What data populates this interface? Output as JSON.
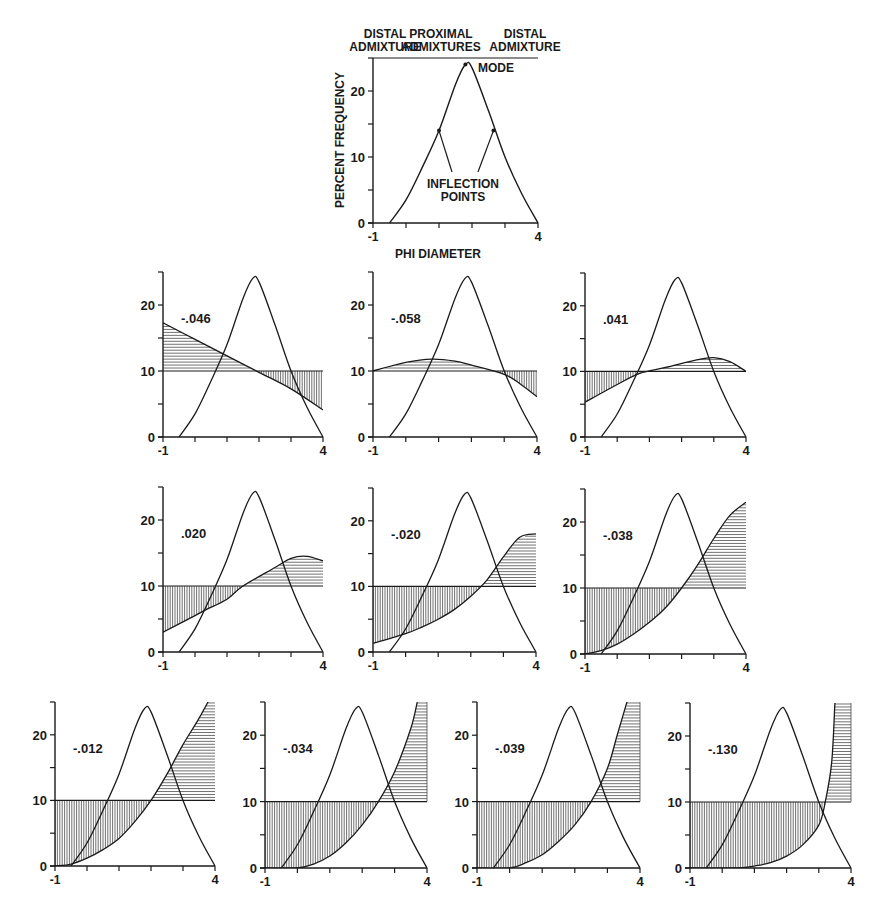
{
  "chart_data": [
    {
      "id": "reference",
      "type": "line",
      "title": "",
      "xlabel": "PHI DIAMETER",
      "ylabel": "PERCENT FREQUENCY",
      "xlim": [
        -1,
        4
      ],
      "ylim": [
        0,
        25
      ],
      "x_tick_labels": [
        "-1",
        "4"
      ],
      "y_tick_labels": [
        "0",
        "10",
        "20"
      ],
      "grid": false,
      "annotations": {
        "top_labels": [
          {
            "line1": "DISTAL",
            "line2": "ADMIXTURE"
          },
          {
            "line1": "PROXIMAL",
            "line2": "ADMIXTURES"
          },
          {
            "line1": "DISTAL",
            "line2": "ADMIXTURE"
          }
        ],
        "mode_label": "MODE",
        "inflection_label_line1": "INFLECTION",
        "inflection_label_line2": "POINTS"
      },
      "series": [
        {
          "name": "grain-size distribution",
          "x": [
            -0.5,
            0,
            0.5,
            1,
            1.5,
            1.8,
            2,
            2.5,
            3,
            3.5,
            4
          ],
          "y": [
            0,
            3.5,
            8.5,
            14,
            21,
            24,
            23.5,
            17,
            10,
            4.5,
            0
          ]
        }
      ],
      "mode": {
        "x": 1.8,
        "y": 24
      },
      "inflection_points": [
        {
          "x": 1.0,
          "y": 14
        },
        {
          "x": 2.65,
          "y": 14
        }
      ]
    },
    {
      "id": "p1",
      "type": "area",
      "label": "-.046",
      "xlim": [
        -1,
        4
      ],
      "ylim": [
        0,
        25
      ],
      "x_tick_labels": [
        "-1",
        "4"
      ],
      "y_tick_labels": [
        "0",
        "10",
        "20"
      ],
      "baseline": 10,
      "series": [
        {
          "name": "distribution",
          "x": [
            -0.5,
            0,
            0.5,
            1,
            1.5,
            1.8,
            2,
            2.5,
            3,
            3.5,
            4
          ],
          "y": [
            0,
            3.5,
            8.5,
            14,
            21,
            24,
            23.5,
            17,
            10,
            4.5,
            0
          ]
        },
        {
          "name": "weighting function",
          "x": [
            -1,
            0,
            1,
            2,
            3,
            4
          ],
          "y": [
            17.3,
            14.8,
            12.3,
            9.8,
            7.3,
            4.1
          ]
        }
      ]
    },
    {
      "id": "p2",
      "type": "area",
      "label": "-.058",
      "xlim": [
        -1,
        4
      ],
      "ylim": [
        0,
        25
      ],
      "x_tick_labels": [
        "-1",
        "4"
      ],
      "y_tick_labels": [
        "0",
        "10",
        "20"
      ],
      "baseline": 10,
      "series": [
        {
          "name": "distribution",
          "x": [
            -0.5,
            0,
            0.5,
            1,
            1.5,
            1.8,
            2,
            2.5,
            3,
            3.5,
            4
          ],
          "y": [
            0,
            3.5,
            8.5,
            14,
            21,
            24,
            23.5,
            17,
            10,
            4.5,
            0
          ]
        },
        {
          "name": "weighting function",
          "x": [
            -1,
            0,
            0.8,
            1.5,
            2,
            3,
            3.5,
            4
          ],
          "y": [
            10,
            11.3,
            11.8,
            11.5,
            10.9,
            9.5,
            8,
            6.1
          ]
        }
      ]
    },
    {
      "id": "p3",
      "type": "area",
      "label": ".041",
      "xlim": [
        -1,
        4
      ],
      "ylim": [
        0,
        25
      ],
      "x_tick_labels": [
        "-1",
        "4"
      ],
      "y_tick_labels": [
        "0",
        "10",
        "20"
      ],
      "baseline": 10,
      "series": [
        {
          "name": "distribution",
          "x": [
            -0.5,
            0,
            0.5,
            1,
            1.5,
            1.8,
            2,
            2.5,
            3,
            3.5,
            4
          ],
          "y": [
            0,
            3.5,
            8.5,
            14,
            21,
            24,
            23.5,
            17,
            10,
            4.5,
            0
          ]
        },
        {
          "name": "weighting function",
          "x": [
            -1,
            0,
            0.7,
            1.5,
            2.5,
            3,
            3.5,
            4
          ],
          "y": [
            5.3,
            8,
            9.7,
            10.6,
            11.8,
            12.1,
            11.5,
            10
          ]
        }
      ]
    },
    {
      "id": "p4",
      "type": "area",
      "label": ".020",
      "xlim": [
        -1,
        4
      ],
      "ylim": [
        0,
        25
      ],
      "x_tick_labels": [
        "-1",
        "4"
      ],
      "y_tick_labels": [
        "0",
        "10",
        "20"
      ],
      "baseline": 10,
      "series": [
        {
          "name": "distribution",
          "x": [
            -0.5,
            0,
            0.5,
            1,
            1.5,
            1.8,
            2,
            2.5,
            3,
            3.5,
            4
          ],
          "y": [
            0,
            3.5,
            8.5,
            14,
            21,
            24,
            23.5,
            17,
            10,
            4.5,
            0
          ]
        },
        {
          "name": "weighting function",
          "x": [
            -1,
            0,
            0.3,
            1,
            1.5,
            2.5,
            3,
            3.5,
            4
          ],
          "y": [
            3,
            5.5,
            6.3,
            8,
            10,
            12.8,
            14.2,
            14.5,
            13.8
          ]
        }
      ]
    },
    {
      "id": "p5",
      "type": "area",
      "label": "-.020",
      "xlim": [
        -1,
        4
      ],
      "ylim": [
        0,
        25
      ],
      "x_tick_labels": [
        "-1",
        "4"
      ],
      "y_tick_labels": [
        "0",
        "10",
        "20"
      ],
      "baseline": 10,
      "series": [
        {
          "name": "distribution",
          "x": [
            -0.5,
            0,
            0.5,
            1,
            1.5,
            1.8,
            2,
            2.5,
            3,
            3.5,
            4
          ],
          "y": [
            0,
            3.5,
            8.5,
            14,
            21,
            24,
            23.5,
            17,
            10,
            4.5,
            0
          ]
        },
        {
          "name": "weighting function",
          "x": [
            -1,
            0,
            0.5,
            1,
            1.5,
            2,
            2.5,
            3,
            3.5,
            4
          ],
          "y": [
            1.3,
            2.8,
            3.8,
            5,
            6.5,
            8.5,
            11,
            14.5,
            17.5,
            18
          ]
        }
      ]
    },
    {
      "id": "p6",
      "type": "area",
      "label": "-.038",
      "xlim": [
        -1,
        4
      ],
      "ylim": [
        0,
        25
      ],
      "x_tick_labels": [
        "-1",
        "4"
      ],
      "y_tick_labels": [
        "0",
        "10",
        "20"
      ],
      "baseline": 10,
      "series": [
        {
          "name": "distribution",
          "x": [
            -0.5,
            0,
            0.5,
            1,
            1.5,
            1.8,
            2,
            2.5,
            3,
            3.5,
            4
          ],
          "y": [
            0,
            3.5,
            8.5,
            14,
            21,
            24,
            23.5,
            17,
            10,
            4.5,
            0
          ]
        },
        {
          "name": "weighting function",
          "x": [
            -1,
            -0.5,
            0,
            0.5,
            1,
            1.5,
            2,
            2.5,
            3,
            3.5,
            4
          ],
          "y": [
            0,
            0.5,
            1.5,
            3,
            4.8,
            7,
            10,
            13.5,
            17.5,
            21,
            23
          ]
        }
      ]
    },
    {
      "id": "p7",
      "type": "area",
      "label": "-.012",
      "xlim": [
        -1,
        4
      ],
      "ylim": [
        0,
        25
      ],
      "x_tick_labels": [
        "-1",
        "4"
      ],
      "y_tick_labels": [
        "0",
        "10",
        "20"
      ],
      "baseline": 10,
      "series": [
        {
          "name": "distribution",
          "x": [
            -0.5,
            0,
            0.5,
            1,
            1.5,
            1.8,
            2,
            2.5,
            3,
            3.5,
            4
          ],
          "y": [
            0,
            3.5,
            8.5,
            14,
            21,
            24,
            23.5,
            17,
            10,
            4.5,
            0
          ]
        },
        {
          "name": "weighting function",
          "x": [
            -1,
            -0.5,
            0,
            0.5,
            1,
            1.5,
            2,
            2.5,
            3,
            3.5,
            4
          ],
          "y": [
            0,
            0.3,
            1.2,
            2.5,
            4.2,
            6.8,
            10,
            14,
            18.5,
            22.5,
            27
          ]
        }
      ]
    },
    {
      "id": "p8",
      "type": "area",
      "label": "-.034",
      "xlim": [
        -1,
        4
      ],
      "ylim": [
        0,
        25
      ],
      "x_tick_labels": [
        "-1",
        "4"
      ],
      "y_tick_labels": [
        "0",
        "10",
        "20"
      ],
      "baseline": 10,
      "series": [
        {
          "name": "distribution",
          "x": [
            -0.5,
            0,
            0.5,
            1,
            1.5,
            1.8,
            2,
            2.5,
            3,
            3.5,
            4
          ],
          "y": [
            0,
            3.5,
            8.5,
            14,
            21,
            24,
            23.5,
            17,
            10,
            4.5,
            0
          ]
        },
        {
          "name": "weighting function",
          "x": [
            -1,
            0,
            0.5,
            1,
            1.5,
            2,
            2.5,
            3,
            3.5,
            3.7
          ],
          "y": [
            0,
            0,
            0.6,
            1.8,
            3.8,
            6.5,
            10,
            14.5,
            21,
            25
          ]
        }
      ]
    },
    {
      "id": "p9",
      "type": "area",
      "label": "-.039",
      "xlim": [
        -1,
        4
      ],
      "ylim": [
        0,
        25
      ],
      "x_tick_labels": [
        "-1",
        "4"
      ],
      "y_tick_labels": [
        "0",
        "10",
        "20"
      ],
      "baseline": 10,
      "series": [
        {
          "name": "distribution",
          "x": [
            -0.5,
            0,
            0.5,
            1,
            1.5,
            1.8,
            2,
            2.5,
            3,
            3.5,
            4
          ],
          "y": [
            0,
            3.5,
            8.5,
            14,
            21,
            24,
            23.5,
            17,
            10,
            4.5,
            0
          ]
        },
        {
          "name": "weighting function",
          "x": [
            -1,
            0,
            0.5,
            1,
            1.5,
            2,
            2.5,
            3,
            3.3,
            3.6
          ],
          "y": [
            0,
            0,
            0.8,
            2,
            4,
            6.5,
            10,
            15,
            20,
            25
          ]
        }
      ]
    },
    {
      "id": "p10",
      "type": "area",
      "label": "-.130",
      "xlim": [
        -1,
        4
      ],
      "ylim": [
        0,
        25
      ],
      "x_tick_labels": [
        "-1",
        "4"
      ],
      "y_tick_labels": [
        "0",
        "10",
        "20"
      ],
      "baseline": 10,
      "series": [
        {
          "name": "distribution",
          "x": [
            -0.5,
            0,
            0.5,
            1,
            1.5,
            1.8,
            2,
            2.5,
            3,
            3.5,
            4
          ],
          "y": [
            0,
            3.5,
            8.5,
            14,
            21,
            24,
            23.5,
            17,
            10,
            4.5,
            0
          ]
        },
        {
          "name": "weighting function",
          "x": [
            -1,
            0.5,
            1,
            1.5,
            2,
            2.5,
            3,
            3.2,
            3.4,
            3.5
          ],
          "y": [
            0,
            0,
            0.3,
            0.8,
            1.8,
            3.5,
            6.5,
            10,
            16,
            25
          ]
        }
      ]
    }
  ],
  "layout": {
    "reference": {
      "x0": 373,
      "x1": 538,
      "y0": 223,
      "yTop": 58
    },
    "panels": [
      {
        "x0": 163,
        "x1": 323,
        "y0": 437,
        "yTop": 272
      },
      {
        "x0": 373,
        "x1": 537,
        "y0": 437,
        "yTop": 272
      },
      {
        "x0": 585,
        "x1": 746,
        "y0": 437,
        "yTop": 273
      },
      {
        "x0": 163,
        "x1": 323,
        "y0": 652,
        "yTop": 487
      },
      {
        "x0": 373,
        "x1": 536,
        "y0": 652,
        "yTop": 488
      },
      {
        "x0": 585,
        "x1": 746,
        "y0": 654,
        "yTop": 489
      },
      {
        "x0": 55,
        "x1": 215,
        "y0": 866,
        "yTop": 702
      },
      {
        "x0": 265,
        "x1": 427,
        "y0": 868,
        "yTop": 702
      },
      {
        "x0": 477,
        "x1": 640,
        "y0": 868,
        "yTop": 702
      },
      {
        "x0": 690,
        "x1": 851,
        "y0": 868,
        "yTop": 703
      }
    ]
  },
  "colors": {
    "ink": "#1a1a1a",
    "hatch": "#333333",
    "background": "#ffffff"
  }
}
